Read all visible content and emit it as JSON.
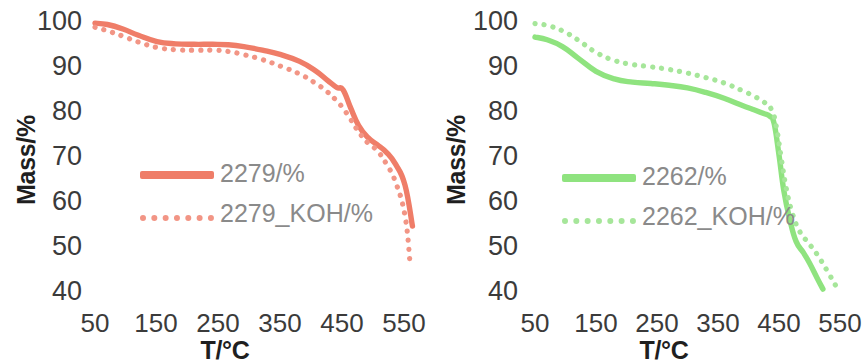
{
  "figure": {
    "background": "#ffffff",
    "panel_count": 2
  },
  "chart_data": [
    {
      "type": "line",
      "title": "",
      "panel": "left",
      "xlabel": "T/°C",
      "ylabel": "Mass/%",
      "xlim": [
        50,
        570
      ],
      "ylim": [
        40,
        100
      ],
      "xticks": [
        50,
        150,
        250,
        350,
        450,
        550
      ],
      "xtick_labels": [
        "50",
        "150",
        "250",
        "350",
        "450",
        "550"
      ],
      "yticks": [
        40,
        50,
        60,
        70,
        80,
        90,
        100
      ],
      "ytick_labels": [
        "40",
        "50",
        "60",
        "70",
        "80",
        "90",
        "100"
      ],
      "grid": false,
      "legend_position": "center-left",
      "colors": {
        "solid": "#EF7D68",
        "dotted": "#F29585"
      },
      "series": [
        {
          "name": "2279/%",
          "style": "solid",
          "color": "#EF7D68",
          "x": [
            50,
            70,
            95,
            120,
            150,
            180,
            210,
            240,
            265,
            290,
            320,
            350,
            380,
            405,
            425,
            440,
            450,
            462,
            475,
            490,
            505,
            520,
            535,
            550,
            562
          ],
          "values": [
            99.3,
            99.0,
            98.0,
            96.6,
            95.2,
            94.7,
            94.6,
            94.6,
            94.5,
            94.1,
            93.3,
            92.3,
            90.8,
            88.8,
            86.6,
            85.0,
            84.5,
            80.6,
            76.6,
            73.9,
            72.3,
            70.6,
            67.9,
            63.3,
            54.2
          ]
        },
        {
          "name": "2279_KOH/%",
          "style": "dotted",
          "color": "#F29585",
          "x": [
            50,
            70,
            95,
            120,
            150,
            180,
            210,
            240,
            265,
            290,
            320,
            350,
            380,
            405,
            425,
            440,
            450,
            462,
            475,
            490,
            505,
            520,
            535,
            550,
            558
          ],
          "values": [
            98.4,
            97.6,
            96.4,
            95.1,
            93.9,
            93.4,
            93.3,
            93.3,
            93.0,
            92.3,
            91.2,
            89.7,
            88.0,
            86.0,
            84.0,
            82.0,
            80.4,
            78.0,
            75.2,
            72.7,
            71.0,
            68.0,
            63.9,
            56.5,
            46.2
          ]
        }
      ]
    },
    {
      "type": "line",
      "title": "",
      "panel": "right",
      "xlabel": "T/°C",
      "ylabel": "Mass/%",
      "xlim": [
        50,
        560
      ],
      "ylim": [
        40,
        100
      ],
      "xticks": [
        50,
        150,
        250,
        350,
        450,
        550
      ],
      "xtick_labels": [
        "50",
        "150",
        "250",
        "350",
        "450",
        "550"
      ],
      "yticks": [
        40,
        50,
        60,
        70,
        80,
        90,
        100
      ],
      "ytick_labels": [
        "40",
        "50",
        "60",
        "70",
        "80",
        "90",
        "100"
      ],
      "grid": false,
      "legend_position": "center-left",
      "colors": {
        "solid": "#8FE37F",
        "dotted": "#A6E69A"
      },
      "series": [
        {
          "name": "2262/%",
          "style": "solid",
          "color": "#8FE37F",
          "x": [
            50,
            70,
            95,
            120,
            150,
            180,
            210,
            240,
            270,
            300,
            330,
            360,
            390,
            410,
            425,
            435,
            442,
            450,
            458,
            468,
            478,
            490,
            500,
            512,
            522
          ],
          "values": [
            96.2,
            95.6,
            94.1,
            91.6,
            88.6,
            86.9,
            86.2,
            85.9,
            85.5,
            84.9,
            83.9,
            82.6,
            81.0,
            80.0,
            79.2,
            78.6,
            77.0,
            70.0,
            62.0,
            55.5,
            50.8,
            48.3,
            46.0,
            42.8,
            40.2
          ]
        },
        {
          "name": "2262_KOH/%",
          "style": "dotted",
          "color": "#A6E69A",
          "x": [
            50,
            70,
            95,
            120,
            150,
            180,
            210,
            240,
            270,
            300,
            330,
            360,
            390,
            410,
            425,
            438,
            446,
            454,
            462,
            472,
            484,
            498,
            512,
            528,
            545
          ],
          "values": [
            99.2,
            98.8,
            97.6,
            95.6,
            92.8,
            91.0,
            90.1,
            89.6,
            89.0,
            88.2,
            87.2,
            86.0,
            84.3,
            83.0,
            81.8,
            80.0,
            76.0,
            69.0,
            62.5,
            57.0,
            53.0,
            50.5,
            48.0,
            44.5,
            40.5
          ]
        }
      ]
    }
  ],
  "left_panel": {
    "ylabel": "Mass/%",
    "xlabel": "T/°C",
    "yticks": [
      "100",
      "90",
      "80",
      "70",
      "60",
      "50",
      "40"
    ],
    "xticks": [
      "50",
      "150",
      "250",
      "350",
      "450",
      "550"
    ],
    "legend": [
      {
        "label": "2279/%",
        "style": "solid",
        "color": "#EF7D68"
      },
      {
        "label": "2279_KOH/%",
        "style": "dotted",
        "color": "#F29585"
      }
    ]
  },
  "right_panel": {
    "ylabel": "Mass/%",
    "xlabel": "T/°C",
    "yticks": [
      "100",
      "90",
      "80",
      "70",
      "60",
      "50",
      "40"
    ],
    "xticks": [
      "50",
      "150",
      "250",
      "350",
      "450",
      "550"
    ],
    "legend": [
      {
        "label": "2262/%",
        "style": "solid",
        "color": "#8FE37F"
      },
      {
        "label": "2262_KOH/%",
        "style": "dotted",
        "color": "#A6E69A"
      }
    ]
  }
}
